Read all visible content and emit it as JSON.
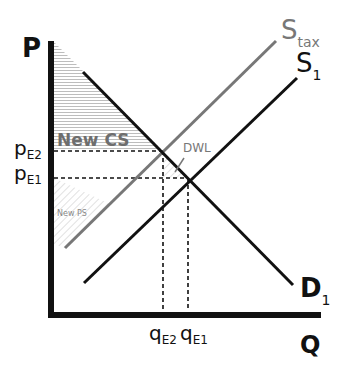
{
  "diagram": {
    "axes": {
      "y_label": "P",
      "x_label": "Q"
    },
    "curves": {
      "demand": {
        "label": "D",
        "subscript": "1"
      },
      "supply_original": {
        "label": "S",
        "subscript": "1"
      },
      "supply_tax": {
        "label": "S",
        "subscript": "tax"
      }
    },
    "price_labels": {
      "pE2": {
        "main": "p",
        "sub": "E2"
      },
      "pE1": {
        "main": "p",
        "sub": "E1"
      }
    },
    "quantity_labels": {
      "qE2": {
        "main": "q",
        "sub": "E2"
      },
      "qE1": {
        "main": "q",
        "sub": "E1"
      }
    },
    "region_labels": {
      "new_cs": "New CS",
      "new_ps": "New PS",
      "dwl": "DWL"
    },
    "colors": {
      "axis": "#111111",
      "demand": "#111111",
      "supply_original": "#111111",
      "supply_tax": "#777777",
      "cs_label": "#6e6e6e",
      "hatch": "#bbbbbb"
    }
  }
}
